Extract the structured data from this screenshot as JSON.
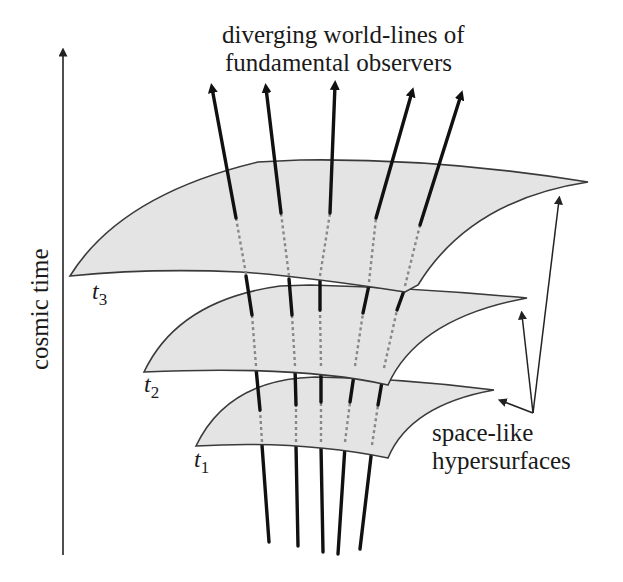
{
  "figure": {
    "title_line1": "diverging world-lines of",
    "title_line2": "fundamental observers",
    "axis_label": "cosmic time",
    "annotation_line1": "space-like",
    "annotation_line2": "hypersurfaces",
    "surfaces": [
      {
        "label": "t",
        "subscript": "1"
      },
      {
        "label": "t",
        "subscript": "2"
      },
      {
        "label": "t",
        "subscript": "3"
      }
    ],
    "world_line_count": 5,
    "colors": {
      "surface_fill": "#e4e4e4",
      "surface_stroke": "#3a3a3a",
      "world_line": "#111111",
      "hidden_segment": "#888888"
    }
  }
}
